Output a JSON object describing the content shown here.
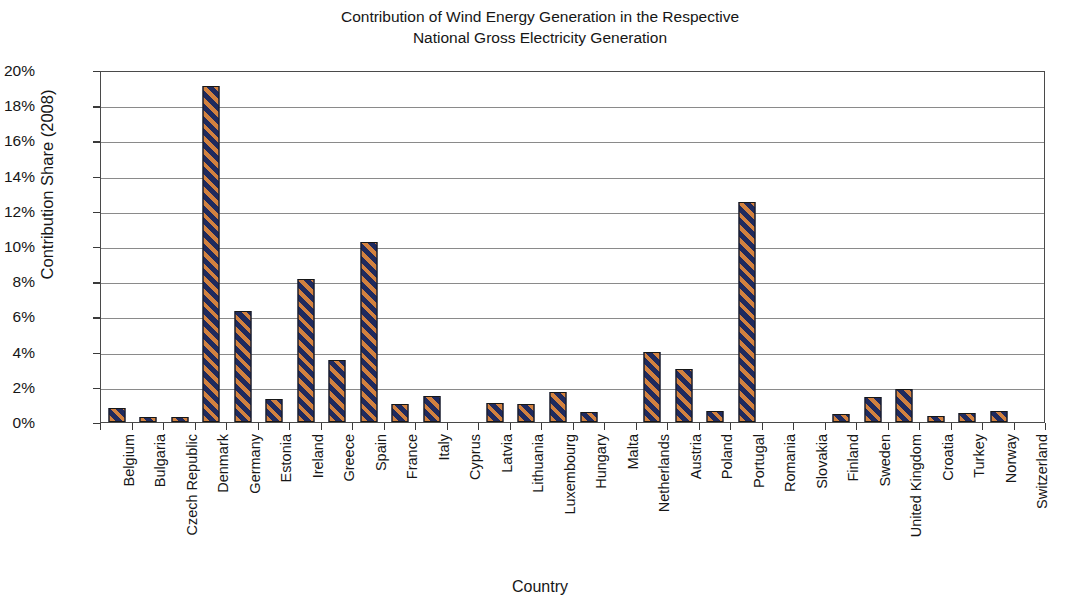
{
  "title": {
    "line1": "Contribution of Wind Energy Generation in the Respective",
    "line2": "National Gross Electricity Generation"
  },
  "axes": {
    "y_title": "Contribution Share (2008)",
    "x_title": "Country"
  },
  "chart_data": {
    "type": "bar",
    "title": "Contribution of Wind Energy Generation in the Respective National Gross Electricity Generation",
    "xlabel": "Country",
    "ylabel": "Contribution Share (2008)",
    "ylim": [
      0,
      20
    ],
    "ytick_labels": [
      "0%",
      "2%",
      "4%",
      "6%",
      "8%",
      "10%",
      "12%",
      "14%",
      "16%",
      "18%",
      "20%"
    ],
    "ytick_values": [
      0,
      2,
      4,
      6,
      8,
      10,
      12,
      14,
      16,
      18,
      20
    ],
    "y_unit": "%",
    "grid": "horizontal",
    "legend": "none",
    "bar_fill": "navy with orange diagonal stripes",
    "categories": [
      "Belgium",
      "Bulgaria",
      "Czech Republic",
      "Denmark",
      "Germany",
      "Estonia",
      "Ireland",
      "Greece",
      "Spain",
      "France",
      "Italy",
      "Cyprus",
      "Latvia",
      "Lithuania",
      "Luxembourg",
      "Hungary",
      "Malta",
      "Netherlands",
      "Austria",
      "Poland",
      "Portugal",
      "Romania",
      "Slovakia",
      "Finland",
      "Sweden",
      "United Kingdom",
      "Croatia",
      "Turkey",
      "Norway",
      "Switzerland"
    ],
    "values": [
      0.8,
      0.3,
      0.3,
      19.1,
      6.3,
      1.3,
      8.1,
      3.5,
      10.25,
      1.0,
      1.5,
      0.0,
      1.1,
      1.0,
      1.7,
      0.55,
      0.0,
      3.95,
      3.0,
      0.6,
      12.5,
      0.0,
      0.05,
      0.45,
      1.4,
      1.85,
      0.35,
      0.5,
      0.65,
      0.05
    ]
  },
  "colors": {
    "bar_base": "#1f2a5e",
    "bar_stripe": "#d2813f",
    "bar_outline": "#171717",
    "gridline": "#8a8a8a",
    "frame": "#4a4a4a",
    "text": "#161616",
    "background": "#ffffff"
  }
}
